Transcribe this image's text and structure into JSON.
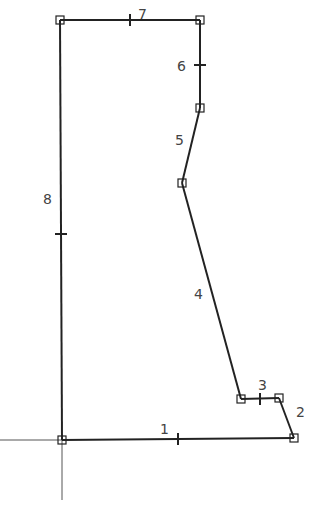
{
  "diagram": {
    "type": "polygon-sketch",
    "line_color": "#222222",
    "axis_color": "#555555",
    "label_color": "#444444",
    "vertices": [
      {
        "x": 62,
        "y": 440
      },
      {
        "x": 294,
        "y": 438
      },
      {
        "x": 279,
        "y": 398
      },
      {
        "x": 241,
        "y": 399
      },
      {
        "x": 182,
        "y": 183
      },
      {
        "x": 200,
        "y": 108
      },
      {
        "x": 200,
        "y": 20
      },
      {
        "x": 60,
        "y": 20
      }
    ],
    "edges": [
      {
        "label": "1",
        "lx": 160,
        "ly": 434,
        "tick": {
          "x": 178,
          "y": 439,
          "dir": "v"
        }
      },
      {
        "label": "2",
        "lx": 296,
        "ly": 417,
        "tick": null
      },
      {
        "label": "3",
        "lx": 258,
        "ly": 390,
        "tick": {
          "x": 260,
          "y": 399,
          "dir": "v"
        }
      },
      {
        "label": "4",
        "lx": 194,
        "ly": 299,
        "tick": null
      },
      {
        "label": "5",
        "lx": 175,
        "ly": 145,
        "tick": null
      },
      {
        "label": "6",
        "lx": 177,
        "ly": 71,
        "tick": {
          "x": 200,
          "y": 65,
          "dir": "h"
        }
      },
      {
        "label": "7",
        "lx": 138,
        "ly": 19,
        "tick": {
          "x": 130,
          "y": 20,
          "dir": "v"
        }
      },
      {
        "label": "8",
        "lx": 43,
        "ly": 204,
        "tick": {
          "x": 61,
          "y": 234,
          "dir": "h"
        }
      }
    ]
  }
}
